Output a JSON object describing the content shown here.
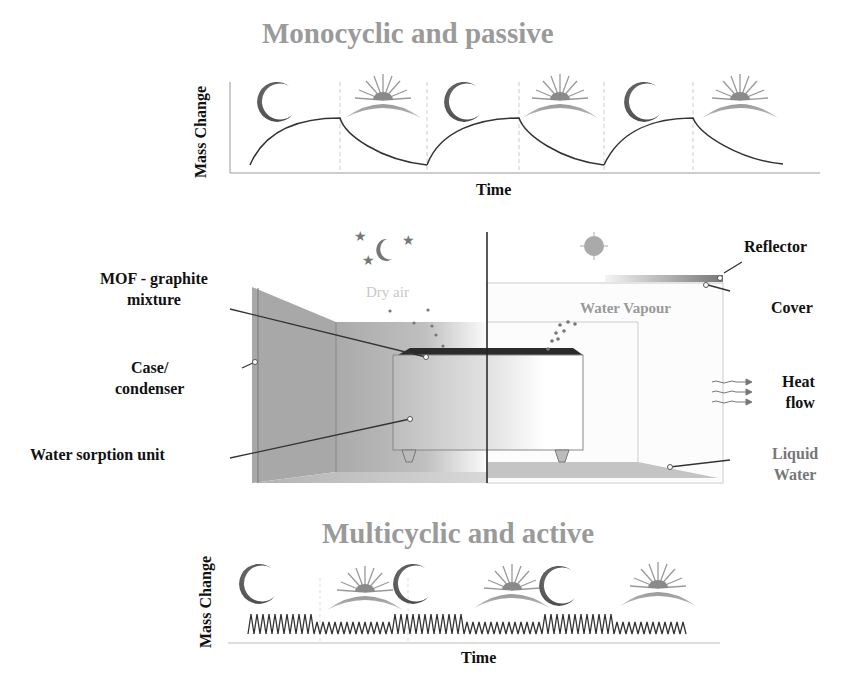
{
  "top_panel": {
    "title": "Monocyclic and passive",
    "ylabel": "Mass Change",
    "xlabel": "Time",
    "cycles": [
      "night",
      "day",
      "night",
      "day",
      "night",
      "day"
    ]
  },
  "middle_panel": {
    "labels": {
      "mof": [
        "MOF - graphite",
        "mixture"
      ],
      "case": [
        "Case/",
        "condenser"
      ],
      "unit": "Water sorption unit",
      "reflector": "Reflector",
      "cover": "Cover",
      "heat": [
        "Heat",
        "flow"
      ],
      "liquid": [
        "Liquid",
        "Water"
      ]
    },
    "inner": {
      "dry_air": "Dry air",
      "water_vapour": "Water Vapour"
    },
    "left_scene": "night",
    "right_scene": "day"
  },
  "bottom_panel": {
    "title": "Multicyclic and active",
    "ylabel": "Mass Change",
    "xlabel": "Time",
    "cycles": [
      "night",
      "day",
      "night",
      "day",
      "night",
      "day"
    ]
  },
  "colors": {
    "title_grey": "#9a9a9a",
    "moon": "#555555",
    "sun": "#8a8a8a",
    "case": "#a9a9a9",
    "mof": "#2b2b2b"
  }
}
